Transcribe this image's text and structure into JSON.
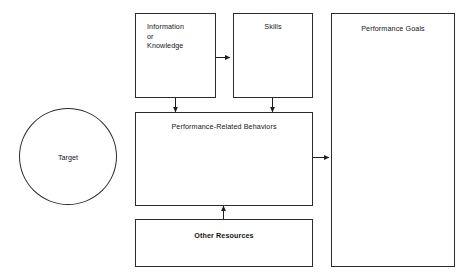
{
  "diagram": {
    "background_color": "#ffffff",
    "line_color": "#1f1f1f",
    "text_color": "#161616",
    "nodes": {
      "target": {
        "label": "Target",
        "shape": "circle"
      },
      "information": {
        "label": "Information\nor\nKnowledge",
        "shape": "rectangle"
      },
      "skills": {
        "label": "Skills",
        "shape": "rectangle"
      },
      "behaviors": {
        "label": "Performance-Related Behaviors",
        "shape": "rectangle"
      },
      "other_resources": {
        "label": "Other Resources",
        "shape": "rectangle",
        "emphasis": "bold"
      },
      "performance_goals": {
        "label": "Performance Goals",
        "shape": "rectangle"
      }
    },
    "connections": [
      {
        "name": "information-to-skills",
        "from": "information",
        "to": "skills",
        "direction": "right"
      },
      {
        "name": "information-to-behaviors",
        "from": "information",
        "to": "behaviors",
        "direction": "down"
      },
      {
        "name": "skills-to-behaviors",
        "from": "skills",
        "to": "behaviors",
        "direction": "down"
      },
      {
        "name": "other-resources-to-behaviors",
        "from": "other_resources",
        "to": "behaviors",
        "direction": "up"
      },
      {
        "name": "behaviors-to-performance-goals",
        "from": "behaviors",
        "to": "performance_goals",
        "direction": "right"
      }
    ]
  }
}
